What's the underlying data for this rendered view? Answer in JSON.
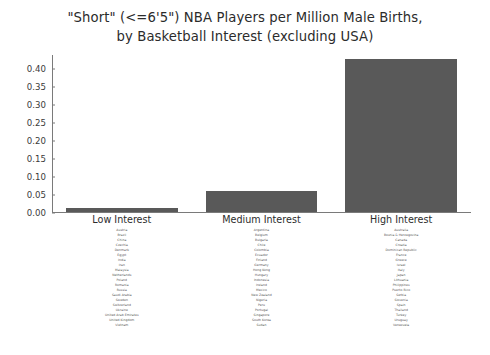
{
  "chart_data": {
    "type": "bar",
    "title": "\"Short\" (<=6'5\") NBA Players per Million Male Births, by Basketball Interest (excluding USA)",
    "title_lines": [
      "\"Short\" (<=6'5\") NBA Players per Million Male Births,",
      "by Basketball Interest (excluding USA)"
    ],
    "categories": [
      "Low Interest",
      "Medium Interest",
      "High Interest"
    ],
    "values": [
      0.012,
      0.057,
      0.425
    ],
    "xlabel": "",
    "ylabel": "",
    "ylim": [
      0.0,
      0.4375
    ],
    "yticks": [
      "0.00",
      "0.05",
      "0.10",
      "0.15",
      "0.20",
      "0.25",
      "0.30",
      "0.35",
      "0.40"
    ],
    "ytick_values": [
      0.0,
      0.05,
      0.1,
      0.15,
      0.2,
      0.25,
      0.3,
      0.35,
      0.4
    ],
    "grid": false,
    "legend": "none",
    "bar_color": "#595959"
  },
  "groups": [
    {
      "label": "Low Interest",
      "value": 0.012,
      "countries": [
        "Austria",
        "Brazil",
        "China",
        "Czechia",
        "Denmark",
        "Egypt",
        "India",
        "Iran",
        "Malaysia",
        "Netherlands",
        "Poland",
        "Romania",
        "Russia",
        "Saudi Arabia",
        "Sweden",
        "Switzerland",
        "Ukraine",
        "United Arab Emirates",
        "United Kingdom",
        "Vietnam"
      ]
    },
    {
      "label": "Medium Interest",
      "value": 0.057,
      "countries": [
        "Argentina",
        "Belgium",
        "Bulgaria",
        "Chile",
        "Colombia",
        "Ecuador",
        "Finland",
        "Germany",
        "Hong Kong",
        "Hungary",
        "Indonesia",
        "Ireland",
        "Mexico",
        "New Zealand",
        "Nigeria",
        "Peru",
        "Portugal",
        "Singapore",
        "South Korea",
        "Sudan"
      ]
    },
    {
      "label": "High Interest",
      "value": 0.425,
      "countries": [
        "Australia",
        "Bosnia & Herzegovina",
        "Canada",
        "Croatia",
        "Dominican Republic",
        "France",
        "Greece",
        "Israel",
        "Italy",
        "Japan",
        "Lithuania",
        "Philippines",
        "Puerto Rico",
        "Serbia",
        "Slovenia",
        "Spain",
        "Thailand",
        "Turkey",
        "Uruguay",
        "Venezuela"
      ]
    }
  ]
}
